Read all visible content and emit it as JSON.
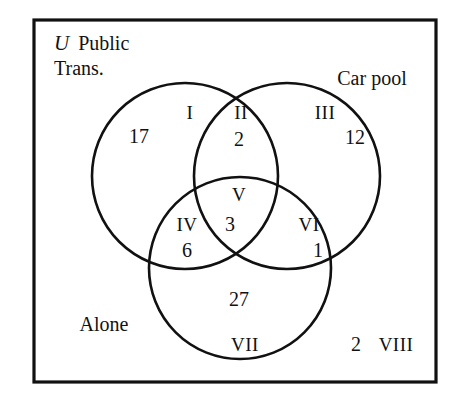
{
  "figure": {
    "kind": "three-circle-venn-diagram",
    "universe_symbol": "U",
    "background_color": "#ffffff",
    "stroke_color": "#111111"
  },
  "sets": {
    "public_transport": {
      "label_line1": "Public",
      "label_line2": "Trans."
    },
    "car_pool": {
      "label": "Car pool"
    },
    "alone": {
      "label": "Alone"
    }
  },
  "regions": [
    {
      "numeral": "I",
      "count": "17",
      "meaning": "public-transport-only"
    },
    {
      "numeral": "II",
      "count": "2",
      "meaning": "public-transport-and-car-pool"
    },
    {
      "numeral": "III",
      "count": "12",
      "meaning": "car-pool-only"
    },
    {
      "numeral": "IV",
      "count": "6",
      "meaning": "public-transport-and-alone"
    },
    {
      "numeral": "V",
      "count": "3",
      "meaning": "all-three"
    },
    {
      "numeral": "VI",
      "count": "1",
      "meaning": "car-pool-and-alone"
    },
    {
      "numeral": "VII",
      "count": "27",
      "meaning": "alone-only"
    },
    {
      "numeral": "VIII",
      "count": "2",
      "meaning": "outside-all-sets"
    }
  ]
}
